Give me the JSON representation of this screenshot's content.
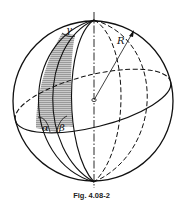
{
  "figure": {
    "caption": "Fig. 4.08-2",
    "labels": {
      "radius": "R",
      "gamma": "γ",
      "alpha": "α",
      "beta": "β"
    },
    "colors": {
      "stroke": "#111111",
      "shade": "#8c8c8c",
      "background": "#ffffff"
    }
  }
}
